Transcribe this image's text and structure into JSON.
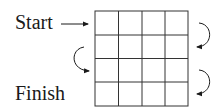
{
  "labels": {
    "start": "Start",
    "finish": "Finish"
  },
  "grid": {
    "rows": 4,
    "cols": 4,
    "x_lines": [
      95,
      118.5,
      142,
      165,
      188
    ],
    "y_lines": [
      11,
      35,
      58.5,
      82,
      106
    ],
    "stroke": "#333333"
  },
  "arrows": [
    {
      "name": "start-arrow",
      "type": "straight",
      "direction": "right",
      "from_row": 1
    },
    {
      "name": "row1-to-row2-arrow",
      "type": "curved",
      "side": "right",
      "direction": "clockwise"
    },
    {
      "name": "row2-to-row3-arrow",
      "type": "curved",
      "side": "left",
      "direction": "counterclockwise"
    },
    {
      "name": "row3-to-row4-arrow",
      "type": "curved",
      "side": "right",
      "direction": "clockwise"
    }
  ],
  "colors": {
    "ink": "#1a1a1a",
    "background": "#ffffff"
  }
}
